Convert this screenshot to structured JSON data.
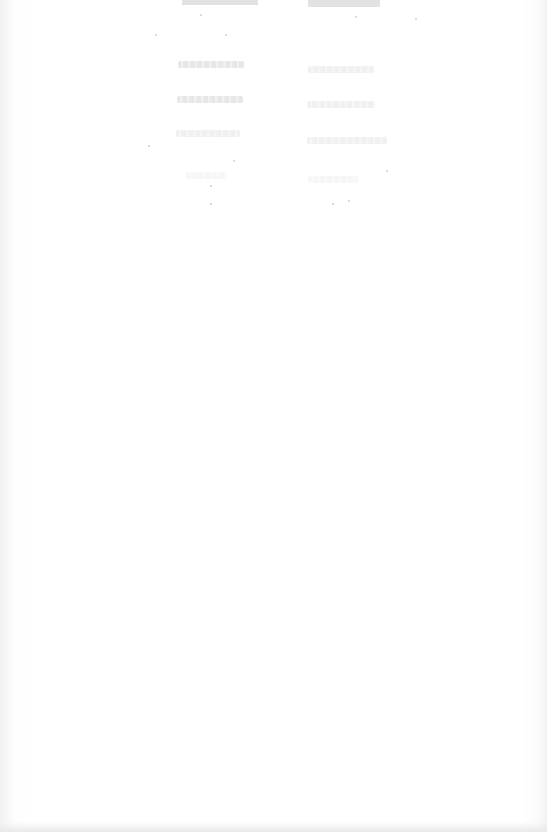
{
  "document": {
    "type": "scanned-page",
    "legibility": "illegible",
    "background_color": "#ffffff",
    "ink_color": "#dcdcdc",
    "header_fragments": [
      {
        "id": "header-left",
        "text": ""
      },
      {
        "id": "header-right",
        "text": ""
      }
    ],
    "rows": [
      {
        "left": "",
        "right": ""
      },
      {
        "left": "",
        "right": ""
      },
      {
        "left": "",
        "right": ""
      },
      {
        "left": "",
        "right": ""
      }
    ]
  }
}
